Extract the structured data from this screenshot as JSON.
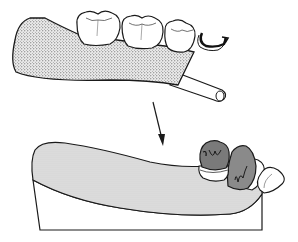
{
  "diagram": {
    "colors": {
      "background": "#ffffff",
      "outline": "#1a1a1a",
      "stipple_base": "#e6e6e6",
      "stipple_dot": "#555555",
      "gum_shade": "#d4d4d4",
      "crown_dark": "#7a7a7a",
      "crown_mid": "#9a9a9a",
      "tooth_white": "#ffffff"
    },
    "top_part": {
      "label": "denture base with molars and clasp",
      "molar_count": 3,
      "has_clasp": true,
      "has_connector_bar": true
    },
    "arrow": {
      "direction": "down-right"
    },
    "bottom_part": {
      "label": "cast with abutment crowns and anterior teeth",
      "crown_count": 2,
      "anterior_teeth_count": 2
    }
  }
}
